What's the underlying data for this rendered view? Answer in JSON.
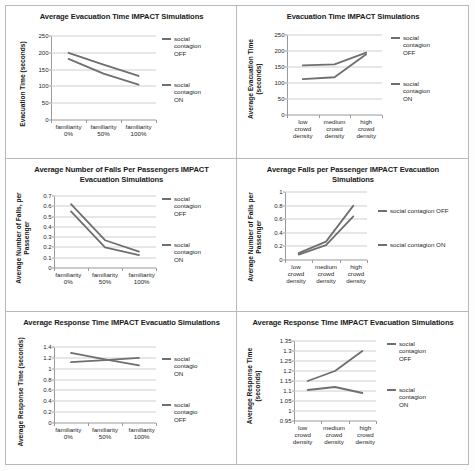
{
  "figure": {
    "panel_count": 6,
    "line_color": "#6f6f6f",
    "gridline_color": "#cfcfcf",
    "axis_color": "#9a9a9a"
  },
  "charts": [
    {
      "id": "evacuation-time-familiarity",
      "type": "line",
      "title": "Average Evacuation Time IMPACT Simulations",
      "ylabel": "Evacuation Time (seconds)",
      "xlabel": "",
      "categories": [
        "familiarity\n0%",
        "familiarity\n50%",
        "familiarity\n100%"
      ],
      "yticks": [
        "0",
        "50",
        "100",
        "150",
        "200",
        "250"
      ],
      "ylim": [
        0,
        250
      ],
      "grid": true,
      "legend_position": "right",
      "series": [
        {
          "name": "social\ncontagion\nOFF",
          "values": [
            200,
            165,
            131
          ]
        },
        {
          "name": "social\ncontagion\nON",
          "values": [
            182,
            138,
            105
          ]
        }
      ]
    },
    {
      "id": "evacuation-time-density",
      "type": "line",
      "title": "Evacuation Time IMPACT Simulations",
      "ylabel": "Average Evacuation Time\n(seconds)",
      "xlabel": "",
      "categories": [
        "low\ncrowd\ndensity",
        "medium\ncrowd\ndensity",
        "high\ncrowd\ndensity"
      ],
      "yticks": [
        "0",
        "50",
        "100",
        "150",
        "200",
        "250"
      ],
      "ylim": [
        0,
        250
      ],
      "grid": true,
      "legend_position": "right",
      "series": [
        {
          "name": "social\ncontagion\nOFF",
          "values": [
            155,
            158,
            195
          ]
        },
        {
          "name": "social\ncontagion\nON",
          "values": [
            112,
            118,
            190
          ]
        }
      ]
    },
    {
      "id": "falls-per-passenger-familiarity",
      "type": "line",
      "title": "Average Number of Falls Per Passengers IMPACT Evacuation Simulations",
      "ylabel": "Average Number of Falls, per\nPassenger",
      "xlabel": "",
      "categories": [
        "familiarity\n0%",
        "familiarity\n50%",
        "familiarity\n100%"
      ],
      "yticks": [
        "0",
        "0.1",
        "0.2",
        "0.3",
        "0.4",
        "0.5",
        "0.6",
        "0.7"
      ],
      "ylim": [
        0,
        0.7
      ],
      "grid": true,
      "legend_position": "right",
      "series": [
        {
          "name": "social\ncontagion\nOFF",
          "values": [
            0.62,
            0.27,
            0.16
          ]
        },
        {
          "name": "social\ncontagion\nON",
          "values": [
            0.55,
            0.2,
            0.125
          ]
        }
      ]
    },
    {
      "id": "falls-per-passenger-density",
      "type": "line",
      "title": "Average Falls per Passenger IMPACT Evacuation Simulations",
      "ylabel": "Average Number of Falls per\nPassenger",
      "xlabel": "",
      "categories": [
        "low\ncrowd\ndensity",
        "medium\ncrowd\ndensity",
        "high\ncrowd\ndensity"
      ],
      "yticks": [
        "0",
        "0.2",
        "0.4",
        "0.6",
        "0.8",
        "1"
      ],
      "ylim": [
        0,
        1
      ],
      "grid": true,
      "legend_position": "right",
      "series": [
        {
          "name": "social contagion OFF",
          "values": [
            0.1,
            0.27,
            0.8
          ]
        },
        {
          "name": "social contagion ON",
          "values": [
            0.08,
            0.22,
            0.64
          ]
        }
      ]
    },
    {
      "id": "response-time-familiarity",
      "type": "line",
      "title": "Average Response Time IMPACT Evacuatio Simulations",
      "ylabel": "Average Response Time (seconds)",
      "xlabel": "",
      "categories": [
        "familiarity\n0%",
        "familiarity\n50%",
        "familiarity\n100%"
      ],
      "yticks": [
        "0",
        "0.2",
        "0.4",
        "0.6",
        "0.8",
        "1",
        "1.2",
        "1.4"
      ],
      "ylim": [
        0,
        1.4
      ],
      "grid": true,
      "legend_position": "right",
      "series": [
        {
          "name": "social\ncontagio\nON",
          "values": [
            1.29,
            1.17,
            1.06
          ]
        },
        {
          "name": "social\ncontagio\nOFF",
          "values": [
            1.12,
            1.16,
            1.2
          ]
        }
      ]
    },
    {
      "id": "response-time-density",
      "type": "line",
      "title": "Average Response Time IMPACT Evacuation Simulations",
      "ylabel": "Average Response Time\n(seconds)",
      "xlabel": "",
      "categories": [
        "low\ncrowd\ndensity",
        "medium\ncrowd\ndensity",
        "high\ncrowd\ndensity"
      ],
      "yticks": [
        "0.95",
        "1",
        "1.05",
        "1.1",
        "1.15",
        "1.2",
        "1.25",
        "1.3",
        "1.35"
      ],
      "ylim": [
        0.95,
        1.35
      ],
      "grid": true,
      "legend_position": "right",
      "series": [
        {
          "name": "social\ncontagion\nOFF",
          "values": [
            1.15,
            1.2,
            1.3
          ]
        },
        {
          "name": "social\ncontagion\nON",
          "values": [
            1.105,
            1.12,
            1.09
          ]
        }
      ]
    }
  ],
  "chart_data": [
    {
      "type": "line",
      "title": "Average Evacuation Time IMPACT Simulations",
      "xlabel": "",
      "ylabel": "Evacuation Time (seconds)",
      "categories": [
        "familiarity 0%",
        "familiarity 50%",
        "familiarity 100%"
      ],
      "ylim": [
        0,
        250
      ],
      "yticks": [
        0,
        50,
        100,
        150,
        200,
        250
      ],
      "grid": true,
      "legend": [
        "social contagion OFF",
        "social contagion ON"
      ],
      "legend_position": "right",
      "series": [
        {
          "name": "social contagion OFF",
          "values": [
            200,
            165,
            131
          ]
        },
        {
          "name": "social contagion ON",
          "values": [
            182,
            138,
            105
          ]
        }
      ]
    },
    {
      "type": "line",
      "title": "Evacuation Time IMPACT Simulations",
      "xlabel": "",
      "ylabel": "Average Evacuation Time (seconds)",
      "categories": [
        "low crowd density",
        "medium crowd density",
        "high crowd density"
      ],
      "ylim": [
        0,
        250
      ],
      "yticks": [
        0,
        50,
        100,
        150,
        200,
        250
      ],
      "grid": true,
      "legend": [
        "social contagion OFF",
        "social contagion ON"
      ],
      "legend_position": "right",
      "series": [
        {
          "name": "social contagion OFF",
          "values": [
            155,
            158,
            195
          ]
        },
        {
          "name": "social contagion ON",
          "values": [
            112,
            118,
            190
          ]
        }
      ]
    },
    {
      "type": "line",
      "title": "Average Number of Falls Per Passengers IMPACT Evacuation Simulations",
      "xlabel": "",
      "ylabel": "Average Number of Falls, per Passenger",
      "categories": [
        "familiarity 0%",
        "familiarity 50%",
        "familiarity 100%"
      ],
      "ylim": [
        0,
        0.7
      ],
      "yticks": [
        0,
        0.1,
        0.2,
        0.3,
        0.4,
        0.5,
        0.6,
        0.7
      ],
      "grid": true,
      "legend": [
        "social contagion OFF",
        "social contagion ON"
      ],
      "legend_position": "right",
      "series": [
        {
          "name": "social contagion OFF",
          "values": [
            0.62,
            0.27,
            0.16
          ]
        },
        {
          "name": "social contagion ON",
          "values": [
            0.55,
            0.2,
            0.125
          ]
        }
      ]
    },
    {
      "type": "line",
      "title": "Average Falls per Passenger IMPACT Evacuation Simulations",
      "xlabel": "",
      "ylabel": "Average Number of Falls per Passenger",
      "categories": [
        "low crowd density",
        "medium crowd density",
        "high crowd density"
      ],
      "ylim": [
        0,
        1
      ],
      "yticks": [
        0,
        0.2,
        0.4,
        0.6,
        0.8,
        1
      ],
      "grid": true,
      "legend": [
        "social contagion OFF",
        "social contagion ON"
      ],
      "legend_position": "right",
      "series": [
        {
          "name": "social contagion OFF",
          "values": [
            0.1,
            0.27,
            0.8
          ]
        },
        {
          "name": "social contagion ON",
          "values": [
            0.08,
            0.22,
            0.64
          ]
        }
      ]
    },
    {
      "type": "line",
      "title": "Average Response Time IMPACT Evacuatio Simulations",
      "xlabel": "",
      "ylabel": "Average Response Time (seconds)",
      "categories": [
        "familiarity 0%",
        "familiarity 50%",
        "familiarity 100%"
      ],
      "ylim": [
        0,
        1.4
      ],
      "yticks": [
        0,
        0.2,
        0.4,
        0.6,
        0.8,
        1,
        1.2,
        1.4
      ],
      "grid": true,
      "legend": [
        "social contagio ON",
        "social contagio OFF"
      ],
      "legend_position": "right",
      "series": [
        {
          "name": "social contagio ON",
          "values": [
            1.29,
            1.17,
            1.06
          ]
        },
        {
          "name": "social contagio OFF",
          "values": [
            1.12,
            1.16,
            1.2
          ]
        }
      ]
    },
    {
      "type": "line",
      "title": "Average Response Time IMPACT Evacuation Simulations",
      "xlabel": "",
      "ylabel": "Average Response Time (seconds)",
      "categories": [
        "low crowd density",
        "medium crowd density",
        "high crowd density"
      ],
      "ylim": [
        0.95,
        1.35
      ],
      "yticks": [
        0.95,
        1,
        1.05,
        1.1,
        1.15,
        1.2,
        1.25,
        1.3,
        1.35
      ],
      "grid": true,
      "legend": [
        "social contagion OFF",
        "social contagion ON"
      ],
      "legend_position": "right",
      "series": [
        {
          "name": "social contagion OFF",
          "values": [
            1.15,
            1.2,
            1.3
          ]
        },
        {
          "name": "social contagion ON",
          "values": [
            1.105,
            1.12,
            1.09
          ]
        }
      ]
    }
  ]
}
